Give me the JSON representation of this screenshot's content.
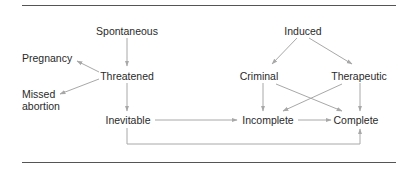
{
  "diagram": {
    "nodes": {
      "spontaneous": "Spontaneous",
      "threatened": "Threatened",
      "pregnancy": "Pregnancy",
      "missed_line1": "Missed",
      "missed_line2": "abortion",
      "inevitable": "Inevitable",
      "induced": "Induced",
      "criminal": "Criminal",
      "therapeutic": "Therapeutic",
      "incomplete": "Incomplete",
      "complete": "Complete"
    },
    "edges": [
      {
        "from": "Spontaneous",
        "to": "Threatened"
      },
      {
        "from": "Threatened",
        "to": "Pregnancy"
      },
      {
        "from": "Threatened",
        "to": "Missed abortion"
      },
      {
        "from": "Threatened",
        "to": "Inevitable"
      },
      {
        "from": "Inevitable",
        "to": "Incomplete"
      },
      {
        "from": "Inevitable",
        "to": "Complete"
      },
      {
        "from": "Induced",
        "to": "Criminal"
      },
      {
        "from": "Induced",
        "to": "Therapeutic"
      },
      {
        "from": "Criminal",
        "to": "Incomplete"
      },
      {
        "from": "Criminal",
        "to": "Complete"
      },
      {
        "from": "Therapeutic",
        "to": "Incomplete"
      },
      {
        "from": "Therapeutic",
        "to": "Complete"
      },
      {
        "from": "Incomplete",
        "to": "Complete"
      }
    ],
    "colors": {
      "edge": "#a8a8a8",
      "text": "#2a2a2a",
      "rule": "#555555"
    }
  }
}
